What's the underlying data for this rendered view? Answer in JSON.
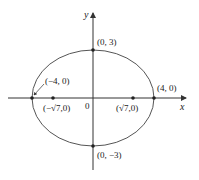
{
  "diagram": {
    "type": "ellipse",
    "equation_params": {
      "a": 4,
      "b": 3,
      "c_sq": 7
    },
    "axes": {
      "x_label": "x",
      "y_label": "y",
      "origin_label": "0"
    },
    "points": [
      {
        "id": "top-vertex",
        "label": "(0, 3)"
      },
      {
        "id": "bottom-vertex",
        "label": "(0, −3)"
      },
      {
        "id": "left-vertex",
        "label": "(−4, 0)"
      },
      {
        "id": "right-vertex",
        "label": "(4, 0)"
      },
      {
        "id": "left-focus",
        "label": "(−√7,0)"
      },
      {
        "id": "right-focus",
        "label": "(√7,0)"
      }
    ],
    "colors": {
      "curve": "#555555",
      "axis": "#333333",
      "point": "#222222"
    }
  }
}
